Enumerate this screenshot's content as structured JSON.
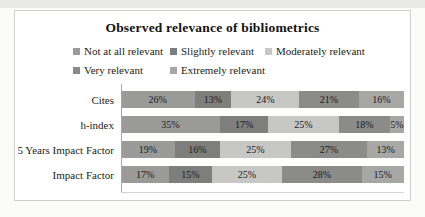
{
  "title": "Observed relevance of bibliometrics",
  "chart_data": {
    "type": "bar",
    "orientation": "horizontal-stacked",
    "title": "Observed relevance of bibliometrics",
    "categories": [
      "Cites",
      "h-index",
      "5 Years Impact Factor",
      "Impact Factor"
    ],
    "series": [
      {
        "name": "Not at all relevant",
        "color": "#9a9a98",
        "values": [
          26,
          35,
          19,
          17
        ]
      },
      {
        "name": "Slightly relevant",
        "color": "#7e7e7c",
        "values": [
          13,
          17,
          16,
          15
        ]
      },
      {
        "name": "Moderately relevant",
        "color": "#c7c7c5",
        "values": [
          24,
          25,
          25,
          25
        ]
      },
      {
        "name": "Very relevant",
        "color": "#8b8b89",
        "values": [
          21,
          18,
          27,
          28
        ]
      },
      {
        "name": "Extremely relevant",
        "color": "#a7a7a5",
        "values": [
          16,
          5,
          13,
          15
        ]
      }
    ],
    "data_labels": [
      [
        "26%",
        "13%",
        "24%",
        "21%",
        "16%"
      ],
      [
        "35%",
        "17%",
        "25%",
        "18%",
        "5%"
      ],
      [
        "19%",
        "16%",
        "25%",
        "27%",
        "13%"
      ],
      [
        "17%",
        "15%",
        "25%",
        "28%",
        "15%"
      ]
    ],
    "value_format": "percent",
    "xlim": [
      0,
      100
    ],
    "grid": false,
    "legend_position": "top",
    "legend_rows": [
      [
        0,
        1,
        2
      ],
      [
        3,
        4
      ]
    ]
  }
}
